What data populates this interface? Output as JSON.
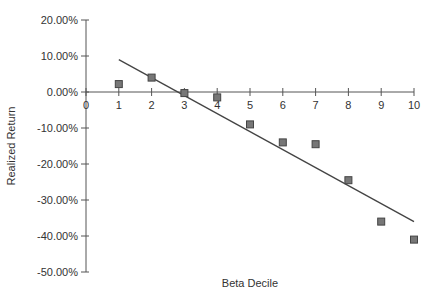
{
  "chart_data": {
    "type": "scatter",
    "title": "",
    "xlabel": "Beta Decile",
    "ylabel": "Realized Return",
    "xlim": [
      0,
      10
    ],
    "ylim": [
      -50,
      20
    ],
    "x_ticks": [
      0,
      1,
      2,
      3,
      4,
      5,
      6,
      7,
      8,
      9,
      10
    ],
    "y_ticks": [
      20,
      10,
      0,
      -10,
      -20,
      -30,
      -40,
      -50
    ],
    "y_tick_labels": [
      "20.00%",
      "10.00%",
      "0.00%",
      "-10.00%",
      "-20.00%",
      "-30.00%",
      "-40.00%",
      "-50.00%"
    ],
    "grid": false,
    "legend": null,
    "series": [
      {
        "name": "Realized Return",
        "type": "scatter",
        "marker": "square",
        "x": [
          1,
          2,
          3,
          4,
          5,
          6,
          7,
          8,
          9,
          10
        ],
        "values": [
          2.2,
          4.0,
          -0.3,
          -1.5,
          -9.0,
          -14.0,
          -14.5,
          -24.5,
          -36.0,
          -41.0
        ]
      },
      {
        "name": "Trend line",
        "type": "line",
        "x": [
          1,
          10
        ],
        "values": [
          9.0,
          -36.0
        ]
      }
    ],
    "colors": {
      "marker_fill": "#777777",
      "marker_stroke": "#444444",
      "line": "#444444",
      "axis": "#555555"
    }
  }
}
